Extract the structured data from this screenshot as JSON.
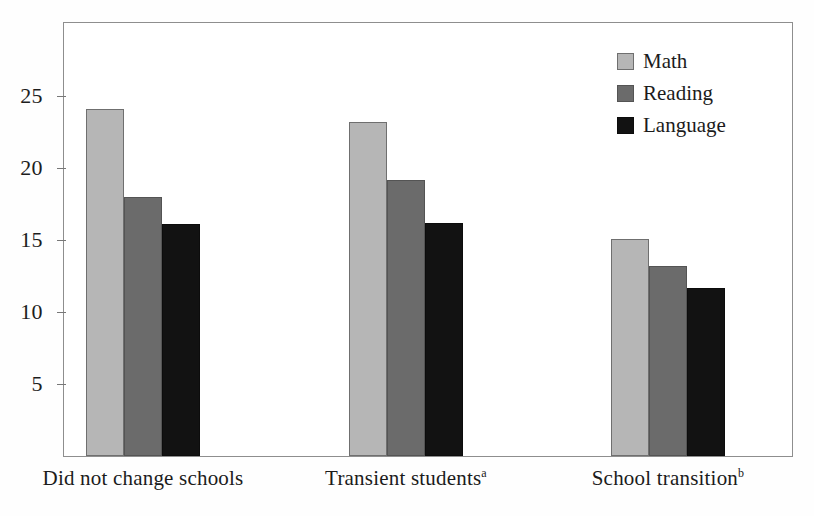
{
  "chart_data": {
    "type": "bar",
    "title": "",
    "subtitle": "",
    "xlabel": "",
    "ylabel": "",
    "categories": [
      "Did not change schools",
      "Transient students",
      "School transition"
    ],
    "category_footnotes": [
      "",
      "a",
      "b"
    ],
    "series": [
      {
        "name": "Math",
        "color": "#b6b6b6",
        "values": [
          24.1,
          23.2,
          15.1
        ]
      },
      {
        "name": "Reading",
        "color": "#6b6b6b",
        "values": [
          18.0,
          19.2,
          13.2
        ]
      },
      {
        "name": "Language",
        "color": "#121212",
        "values": [
          16.1,
          16.2,
          11.7
        ]
      }
    ],
    "ylim": [
      0,
      30
    ],
    "yticks": [
      5,
      10,
      15,
      20,
      25
    ],
    "ytick_labels": [
      "5",
      "10",
      "15",
      "20",
      "25"
    ],
    "grid": false,
    "legend_position": "top-right"
  },
  "axis": {
    "ticks": [
      {
        "label": "25",
        "value": 25
      },
      {
        "label": "20",
        "value": 20
      },
      {
        "label": "15",
        "value": 15
      },
      {
        "label": "10",
        "value": 10
      },
      {
        "label": "5",
        "value": 5
      }
    ]
  },
  "legend": {
    "entries": [
      {
        "label": "Math",
        "swatch": "math"
      },
      {
        "label": "Reading",
        "swatch": "reading"
      },
      {
        "label": "Language",
        "swatch": "language"
      }
    ]
  },
  "x_labels": [
    {
      "text": "Did not change schools",
      "note": ""
    },
    {
      "text": "Transient students",
      "note": "a"
    },
    {
      "text": "School transition",
      "note": "b"
    }
  ]
}
